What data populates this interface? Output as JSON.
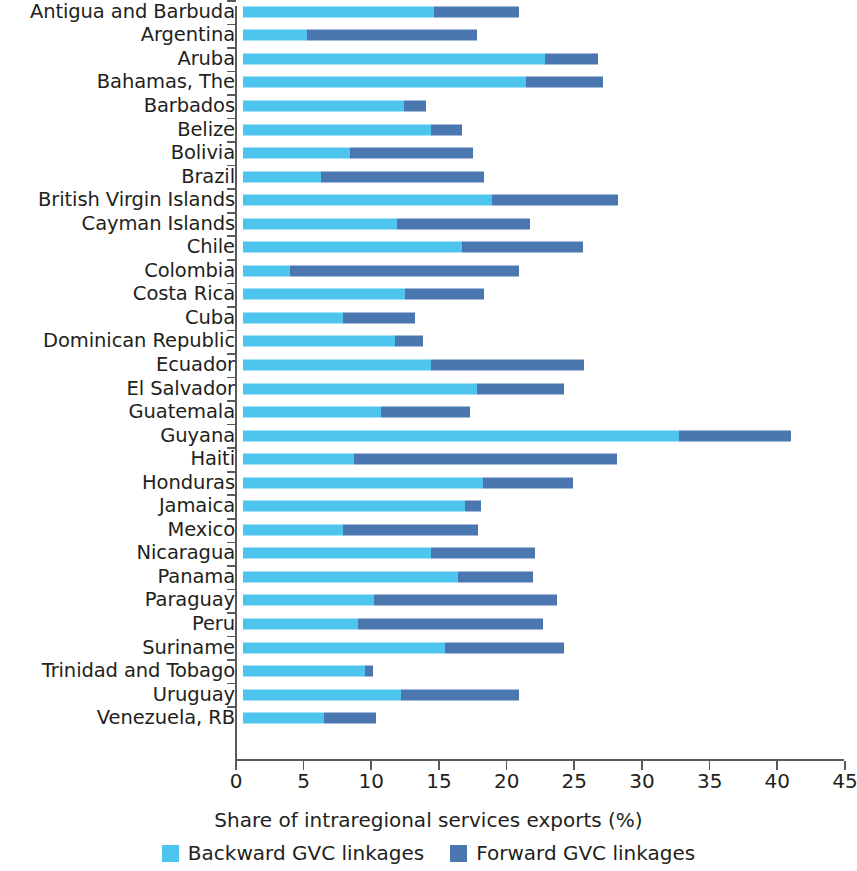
{
  "chart_data": {
    "type": "bar",
    "orientation": "horizontal",
    "stacked": true,
    "title": "",
    "xlabel": "Share of intraregional services exports (%)",
    "ylabel": "",
    "xlim": [
      0,
      45
    ],
    "xticks": [
      0,
      5,
      10,
      15,
      20,
      25,
      30,
      35,
      40,
      45
    ],
    "grid": false,
    "legend_position": "bottom",
    "categories": [
      "Antigua and Barbuda",
      "Argentina",
      "Aruba",
      "Bahamas, The",
      "Barbados",
      "Belize",
      "Bolivia",
      "Brazil",
      "British Virgin Islands",
      "Cayman Islands",
      "Chile",
      "Colombia",
      "Costa Rica",
      "Cuba",
      "Dominican Republic",
      "Ecuador",
      "El Salvador",
      "Guatemala",
      "Guyana",
      "Haiti",
      "Honduras",
      "Jamaica",
      "Mexico",
      "Nicaragua",
      "Panama",
      "Paraguay",
      "Peru",
      "Suriname",
      "Trinidad and Tobago",
      "Uruguay",
      "Venezuela, RB"
    ],
    "series": [
      {
        "name": "Backward GVC linkages",
        "color": "#4ec5ee",
        "values": [
          14.1,
          4.7,
          22.3,
          20.9,
          11.9,
          13.9,
          7.9,
          5.8,
          18.4,
          11.4,
          16.2,
          3.5,
          12.0,
          7.4,
          11.2,
          13.9,
          17.3,
          10.2,
          32.2,
          8.2,
          17.7,
          16.4,
          7.4,
          13.9,
          15.9,
          9.7,
          8.5,
          14.9,
          9.0,
          11.7,
          6.0
        ]
      },
      {
        "name": "Forward GVC linkages",
        "color": "#4b77b0",
        "values": [
          6.3,
          12.6,
          3.9,
          5.7,
          1.6,
          2.3,
          9.1,
          12.0,
          9.3,
          9.8,
          8.9,
          16.9,
          5.8,
          5.3,
          2.1,
          11.3,
          6.4,
          6.6,
          8.3,
          19.4,
          6.7,
          1.2,
          10.0,
          7.7,
          5.5,
          13.5,
          13.7,
          8.8,
          0.6,
          8.7,
          3.8
        ]
      }
    ],
    "totals": [
      20.4,
      17.3,
      26.2,
      26.6,
      13.5,
      16.2,
      17.0,
      17.8,
      27.7,
      21.2,
      25.1,
      20.4,
      17.8,
      12.7,
      13.3,
      25.2,
      23.7,
      16.8,
      40.5,
      27.6,
      24.4,
      17.6,
      17.4,
      21.6,
      21.4,
      23.2,
      22.2,
      23.7,
      9.6,
      20.4,
      9.8
    ]
  },
  "legend": {
    "items": [
      {
        "label": "Backward GVC linkages",
        "color": "#4ec5ee"
      },
      {
        "label": "Forward GVC linkages",
        "color": "#4b77b0"
      }
    ]
  },
  "axis": {
    "x_title": "Share of intraregional services exports (%)",
    "x_tick_labels": [
      "0",
      "5",
      "10",
      "15",
      "20",
      "25",
      "30",
      "35",
      "40",
      "45"
    ]
  }
}
